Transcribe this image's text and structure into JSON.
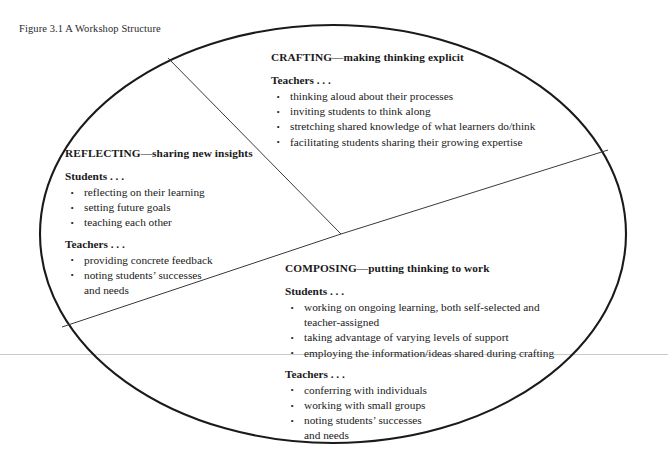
{
  "figure": {
    "caption": "Figure 3.1 A Workshop Structure",
    "shape": "ellipse",
    "colors": {
      "ellipse_stroke": "#1a1a1a",
      "divider_stroke": "#3a3a3a",
      "page_rule": "#c9c9c9",
      "text": "#1a1a1a",
      "background": "#ffffff"
    }
  },
  "sectors": [
    {
      "id": "crafting",
      "heading": "CRAFTING—making thinking explicit",
      "groups": [
        {
          "label": "Teachers . . .",
          "items": [
            "thinking aloud about their processes",
            "inviting students to think along",
            "stretching shared knowledge of what learners do/think",
            "facilitating students sharing their growing expertise"
          ]
        }
      ]
    },
    {
      "id": "reflecting",
      "heading": "REFLECTING—sharing new insights",
      "groups": [
        {
          "label": "Students . . .",
          "items": [
            "reflecting on their learning",
            "setting future goals",
            "teaching each other"
          ]
        },
        {
          "label": "Teachers . . .",
          "items": [
            "providing concrete feedback",
            "noting students’ successes",
            "and needs"
          ]
        }
      ]
    },
    {
      "id": "composing",
      "heading": "COMPOSING—putting thinking to work",
      "groups": [
        {
          "label": "Students . . .",
          "items": [
            "working on ongoing learning, both self-selected and",
            "teacher-assigned",
            "taking advantage of varying levels of support",
            "employing the information/ideas shared during crafting"
          ]
        },
        {
          "label": "Teachers . . .",
          "items": [
            "conferring with individuals",
            "working with small groups",
            "noting students’ successes",
            "and needs"
          ]
        }
      ]
    }
  ],
  "text": {
    "crafting": {
      "heading": "CRAFTING—making thinking explicit",
      "teachers_label": "Teachers . . .",
      "t1": "thinking aloud about their processes",
      "t2": "inviting students to think along",
      "t3": "stretching shared knowledge of what learners do/think",
      "t4": "facilitating students sharing their growing expertise"
    },
    "reflecting": {
      "heading": "REFLECTING—sharing new insights",
      "students_label": "Students . . .",
      "s1": "reflecting on their learning",
      "s2": "setting future goals",
      "s3": "teaching each other",
      "teachers_label": "Teachers . . .",
      "t1": "providing concrete feedback",
      "t2": "noting students’ successes",
      "t2b": "and needs"
    },
    "composing": {
      "heading": "COMPOSING—putting thinking to work",
      "students_label": "Students . . .",
      "s1": "working on ongoing learning, both self-selected and",
      "s1b": "teacher-assigned",
      "s2": "taking advantage of varying levels of support",
      "s3": "employing the information/ideas shared during crafting",
      "teachers_label": "Teachers . . .",
      "t1": "conferring with individuals",
      "t2": "working with small groups",
      "t3": "noting students’ successes",
      "t3b": "and needs"
    }
  }
}
